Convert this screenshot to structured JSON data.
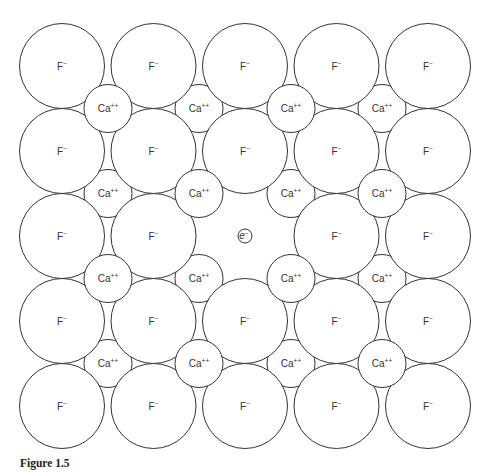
{
  "figure": {
    "caption": "Figure 1.5",
    "line_color": "#333333",
    "fill_color": "#ffffff"
  },
  "lattice": {
    "anion": {
      "symbol": "F",
      "charge": "−",
      "radius": 42.5
    },
    "cation": {
      "symbol": "Ca",
      "charge": "++",
      "radius": 24
    },
    "anion_cols_x": [
      62,
      153.5,
      245,
      336.5,
      428
    ],
    "anion_rows_y": [
      66,
      151,
      236,
      321,
      406
    ],
    "cation_cols_x": [
      108,
      199,
      291,
      382
    ],
    "cation_rows_y": [
      108.5,
      193.5,
      278.5,
      363.5
    ],
    "vacancy": {
      "row": 2,
      "col": 2,
      "label_symbol": "e",
      "label_charge": "−",
      "radius": 7
    }
  }
}
